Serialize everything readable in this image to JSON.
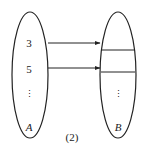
{
  "diagram": {
    "set_a": {
      "label": "A",
      "elements": [
        "3",
        "5",
        "⋮"
      ]
    },
    "set_b": {
      "label": "B",
      "elements": [
        "",
        "",
        "⋮"
      ]
    },
    "mappings": [
      {
        "from": "3",
        "to": "slot-1"
      },
      {
        "from": "5",
        "to": "slot-2"
      }
    ],
    "caption": "(2)"
  }
}
